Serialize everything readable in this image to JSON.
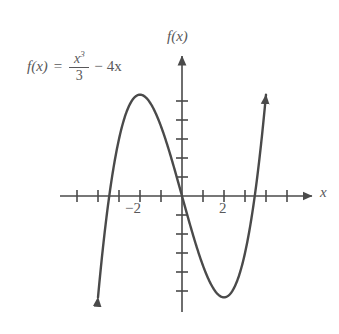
{
  "figure": {
    "background_color": "#ffffff",
    "stroke_color": "#4a4a4a",
    "text_color": "#58585a",
    "width": 339,
    "height": 334
  },
  "formula": {
    "function_name": "f(x)",
    "equals": "=",
    "numerator": "x",
    "numerator_exponent": "3",
    "denominator": "3",
    "operator": "−",
    "last_term": "4x",
    "full_text": "f(x) = x³/3 − 4x"
  },
  "axes": {
    "x_axis_label": "x",
    "y_axis_label": "f(x)",
    "x_tick_labels": [
      "−2",
      "2"
    ],
    "x_tick_label_negative_two": "−2",
    "x_tick_label_two": "2"
  },
  "chart_data": {
    "type": "line",
    "title": "",
    "subtitle": "",
    "xlabel": "x",
    "ylabel": "f(x)",
    "expression": "f(x) = x^3/3 - 4x",
    "grid": false,
    "legend": null,
    "xlim": [
      -5.5,
      5.5
    ],
    "ylim": [
      -7.5,
      7.5
    ],
    "x_ticks": [
      -5,
      -4,
      -3,
      -2,
      -1,
      1,
      2,
      3,
      4,
      5
    ],
    "x_ticks_labeled": [
      -2,
      2
    ],
    "y_ticks": [
      -5,
      -4,
      -3,
      -2,
      -1,
      1,
      2,
      3,
      4,
      5
    ],
    "y_ticks_labeled": [],
    "roots": [
      -3.464,
      0,
      3.464
    ],
    "local_maximum": {
      "x": -2,
      "y": 5.333
    },
    "local_minimum": {
      "x": 2,
      "y": -5.333
    },
    "inflection_point": {
      "x": 0,
      "y": 0
    },
    "series": [
      {
        "name": "f(x) = x^3/3 - 4x",
        "color": "#4a4a4a",
        "x": [
          -4.0,
          -3.8,
          -3.6,
          -3.464,
          -3.4,
          -3.2,
          -3.0,
          -2.8,
          -2.6,
          -2.4,
          -2.2,
          -2.0,
          -1.8,
          -1.6,
          -1.4,
          -1.2,
          -1.0,
          -0.8,
          -0.6,
          -0.4,
          -0.2,
          0.0,
          0.2,
          0.4,
          0.6,
          0.8,
          1.0,
          1.2,
          1.4,
          1.6,
          1.8,
          2.0,
          2.2,
          2.4,
          2.6,
          2.8,
          3.0,
          3.2,
          3.4,
          3.464,
          3.6,
          3.8,
          4.0
        ],
        "y": [
          -5.333,
          -1.709,
          1.848,
          4.0,
          4.29,
          5.272,
          5.0,
          4.88,
          4.544,
          3.992,
          3.249,
          2.345,
          1.256,
          0.034,
          -1.305,
          -2.224,
          -3.667,
          -4.029,
          -4.328,
          -4.579,
          -4.787,
          0.0,
          -0.797,
          -1.579,
          -2.328,
          -3.029,
          -3.667,
          -4.224,
          -4.685,
          -5.034,
          -5.256,
          -5.333,
          -5.249,
          -4.992,
          -4.544,
          -3.888,
          -3.0,
          -1.872,
          -0.49,
          0.0,
          1.152,
          3.091,
          5.333
        ]
      }
    ],
    "arrowheads": [
      {
        "name": "curve-bottom-left-arrow",
        "direction": "down"
      },
      {
        "name": "curve-top-right-arrow",
        "direction": "up"
      },
      {
        "name": "x-axis-right-arrow",
        "direction": "right"
      },
      {
        "name": "y-axis-top-arrow",
        "direction": "up"
      }
    ]
  }
}
